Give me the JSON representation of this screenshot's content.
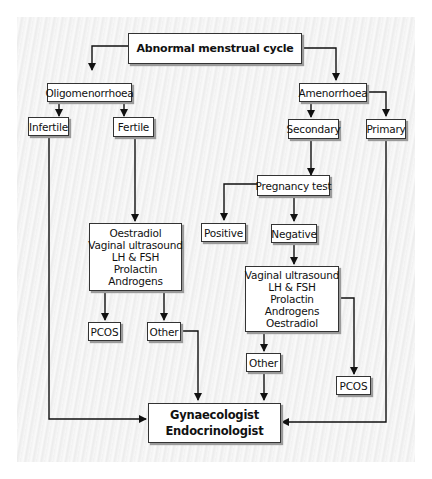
{
  "diagram": {
    "type": "flowchart",
    "root": "Abnormal menstrual cycle",
    "nodes": {
      "root": {
        "lines": [
          "Abnormal menstrual cycle"
        ]
      },
      "oligo": {
        "lines": [
          "Oligomenorrhoea"
        ]
      },
      "amen": {
        "lines": [
          "Amenorrhoea"
        ]
      },
      "infertile": {
        "lines": [
          "Infertile"
        ]
      },
      "fertile": {
        "lines": [
          "Fertile"
        ]
      },
      "secondary": {
        "lines": [
          "Secondary"
        ]
      },
      "primary": {
        "lines": [
          "Primary"
        ]
      },
      "preg": {
        "lines": [
          "Pregnancy test"
        ]
      },
      "positive": {
        "lines": [
          "Positive"
        ]
      },
      "negative": {
        "lines": [
          "Negative"
        ]
      },
      "tests_left": {
        "lines": [
          "Oestradiol",
          "Vaginal ultrasound",
          "LH & FSH",
          "Prolactin",
          "Androgens"
        ]
      },
      "tests_right": {
        "lines": [
          "Vaginal ultrasound",
          "LH & FSH",
          "Prolactin",
          "Androgens",
          "Oestradiol"
        ]
      },
      "pcos_left": {
        "lines": [
          "PCOS"
        ]
      },
      "other_left": {
        "lines": [
          "Other"
        ]
      },
      "other_right": {
        "lines": [
          "Other"
        ]
      },
      "pcos_right": {
        "lines": [
          "PCOS"
        ]
      },
      "specialist": {
        "lines": [
          "Gynaecologist",
          "Endocrinologist"
        ]
      }
    },
    "edges": [
      [
        "root",
        "oligo"
      ],
      [
        "root",
        "amen"
      ],
      [
        "oligo",
        "infertile"
      ],
      [
        "oligo",
        "fertile"
      ],
      [
        "amen",
        "secondary"
      ],
      [
        "amen",
        "primary"
      ],
      [
        "fertile",
        "tests_left"
      ],
      [
        "tests_left",
        "pcos_left"
      ],
      [
        "tests_left",
        "other_left"
      ],
      [
        "secondary",
        "preg"
      ],
      [
        "preg",
        "positive"
      ],
      [
        "preg",
        "negative"
      ],
      [
        "negative",
        "tests_right"
      ],
      [
        "tests_right",
        "other_right"
      ],
      [
        "tests_right",
        "pcos_right"
      ],
      [
        "infertile",
        "specialist"
      ],
      [
        "other_left",
        "specialist"
      ],
      [
        "other_right",
        "specialist"
      ],
      [
        "primary",
        "specialist"
      ]
    ]
  }
}
